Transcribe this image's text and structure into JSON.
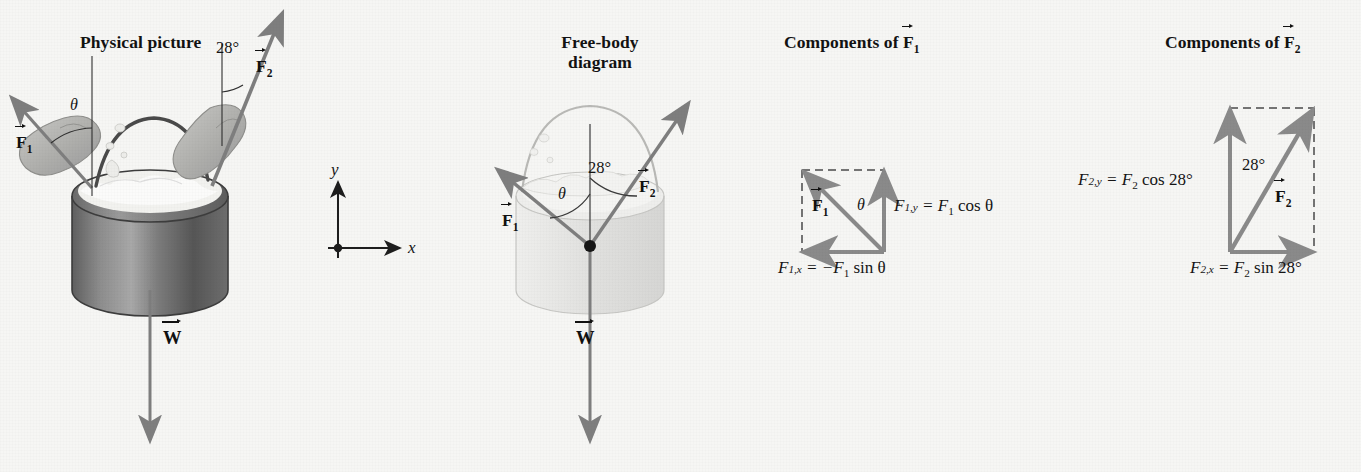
{
  "background_color": "#f6f6f4",
  "vector_color": "#808080",
  "ink_color": "#141414",
  "panels": {
    "physical": {
      "heading": "Physical picture",
      "angle_f2": "28°",
      "label_theta": "θ",
      "label_f1": "F",
      "label_f1_sub": "1",
      "label_f2": "F",
      "label_f2_sub": "2",
      "label_w": "W"
    },
    "axes": {
      "x_label": "x",
      "y_label": "y"
    },
    "fbd": {
      "heading_line1": "Free-body",
      "heading_line2": "diagram",
      "angle_f2": "28°",
      "label_theta": "θ",
      "label_f1": "F",
      "label_f1_sub": "1",
      "label_f2": "F",
      "label_f2_sub": "2",
      "label_w": "W"
    },
    "components_f1": {
      "heading_prefix": "Components of ",
      "heading_vector": "F",
      "heading_sub": "1",
      "label_f1": "F",
      "label_f1_sub": "1",
      "angle_theta": "θ",
      "eq_y": "F",
      "eq_y_sub": "1,y",
      "eq_y_rhs": " = F",
      "eq_y_rhs_sub": "1",
      "eq_y_tail": " cos θ",
      "eq_x": "F",
      "eq_x_sub": "1,x",
      "eq_x_rhs": " = −F",
      "eq_x_rhs_sub": "1",
      "eq_x_tail": " sin θ"
    },
    "components_f2": {
      "heading_prefix": "Components of ",
      "heading_vector": "F",
      "heading_sub": "2",
      "label_f2": "F",
      "label_f2_sub": "2",
      "angle_label": "28°",
      "eq_y": "F",
      "eq_y_sub": "2,y",
      "eq_y_rhs": " = F",
      "eq_y_rhs_sub": "2",
      "eq_y_tail": " cos 28°",
      "eq_x": "F",
      "eq_x_sub": "2,x",
      "eq_x_rhs": " = F",
      "eq_x_rhs_sub": "2",
      "eq_x_tail": " sin 28°"
    }
  }
}
